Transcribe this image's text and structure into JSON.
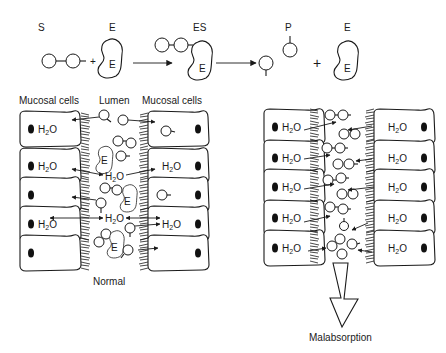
{
  "reaction": {
    "substrate_label": "S",
    "enzyme_label": "E",
    "complex_label": "ES",
    "product_label": "P",
    "enzyme_inner_label": "E",
    "plus_sign": "+"
  },
  "normal_panel": {
    "headers": {
      "left_cells": "Mucosal cells",
      "lumen": "Lumen",
      "right_cells": "Mucosal cells"
    },
    "water_label": "H",
    "water_sub": "2",
    "water_suffix": "O",
    "enzyme_label": "E",
    "caption": "Normal"
  },
  "malabsorption_panel": {
    "water_label": "H",
    "water_sub": "2",
    "water_suffix": "O",
    "caption": "Malabsorption"
  }
}
